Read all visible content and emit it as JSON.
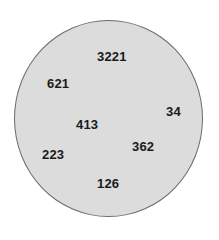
{
  "diagram": {
    "shape": "circle",
    "fill_color": "#dcdcdc",
    "border_color": "#6b6b6b",
    "numbers": [
      {
        "value": "3221",
        "x": 97,
        "y": 49
      },
      {
        "value": "621",
        "x": 47,
        "y": 77
      },
      {
        "value": "34",
        "x": 166,
        "y": 105
      },
      {
        "value": "413",
        "x": 76,
        "y": 118
      },
      {
        "value": "362",
        "x": 132,
        "y": 140
      },
      {
        "value": "223",
        "x": 42,
        "y": 148
      },
      {
        "value": "126",
        "x": 97,
        "y": 177
      }
    ]
  }
}
